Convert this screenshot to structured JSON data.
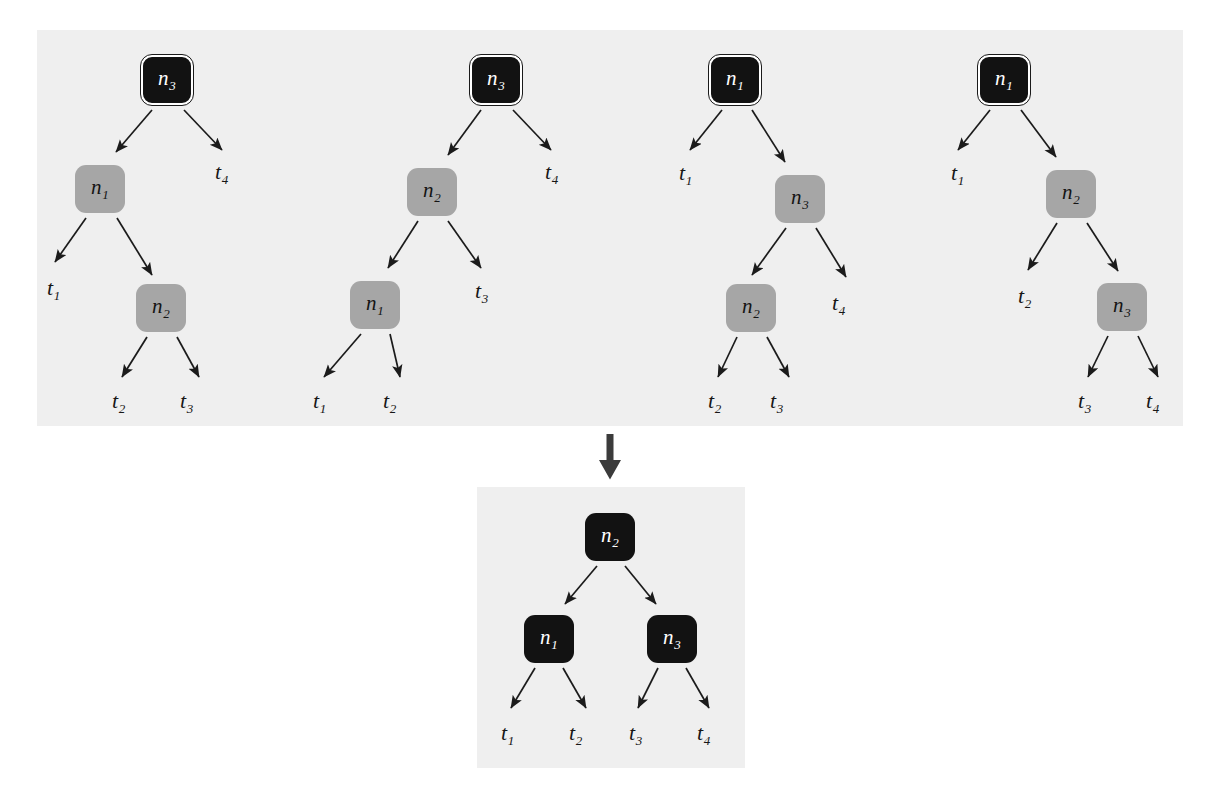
{
  "figure": {
    "type": "tree-diagram",
    "background_color": "#ffffff",
    "panel_color": "#efefef",
    "node_colors": {
      "root_dark": "#121212",
      "internal_gray": "#a6a6a6",
      "consensus_dark": "#121212",
      "ring": "#ffffff"
    }
  },
  "transition": {
    "icon": "down-arrow-icon"
  },
  "top_panel": {
    "label": "Input trees panel",
    "trees": [
      {
        "id": "tree-1",
        "nodes": [
          {
            "id": "t1-root",
            "label": "n",
            "sub": "3",
            "style": "dark-ring",
            "x": 141,
            "y": 55,
            "w": 52,
            "h": 50
          },
          {
            "id": "t1-n1",
            "label": "n",
            "sub": "1",
            "style": "gray",
            "x": 75,
            "y": 165,
            "w": 50,
            "h": 48
          },
          {
            "id": "t1-n2",
            "label": "n",
            "sub": "2",
            "style": "gray",
            "x": 136,
            "y": 284,
            "w": 50,
            "h": 48
          }
        ],
        "leaves": [
          {
            "id": "t1-t4",
            "label": "t",
            "sub": "4",
            "x": 215,
            "y": 161
          },
          {
            "id": "t1-t1",
            "label": "t",
            "sub": "1",
            "x": 47,
            "y": 277
          },
          {
            "id": "t1-t2",
            "label": "t",
            "sub": "2",
            "x": 112,
            "y": 390
          },
          {
            "id": "t1-t3",
            "label": "t",
            "sub": "3",
            "x": 180,
            "y": 390
          }
        ],
        "edges": [
          {
            "x1": 152,
            "y1": 110,
            "x2": 116,
            "y2": 152
          },
          {
            "x1": 184,
            "y1": 110,
            "x2": 222,
            "y2": 150
          },
          {
            "x1": 86,
            "y1": 218,
            "x2": 55,
            "y2": 262
          },
          {
            "x1": 117,
            "y1": 218,
            "x2": 152,
            "y2": 275
          },
          {
            "x1": 147,
            "y1": 337,
            "x2": 122,
            "y2": 377
          },
          {
            "x1": 177,
            "y1": 337,
            "x2": 199,
            "y2": 377
          }
        ]
      },
      {
        "id": "tree-2",
        "nodes": [
          {
            "id": "t2-root",
            "label": "n",
            "sub": "3",
            "style": "dark-ring",
            "x": 470,
            "y": 55,
            "w": 52,
            "h": 50
          },
          {
            "id": "t2-n2",
            "label": "n",
            "sub": "2",
            "style": "gray",
            "x": 407,
            "y": 168,
            "w": 50,
            "h": 48
          },
          {
            "id": "t2-n1",
            "label": "n",
            "sub": "1",
            "style": "gray",
            "x": 350,
            "y": 281,
            "w": 50,
            "h": 48
          }
        ],
        "leaves": [
          {
            "id": "t2-t4",
            "label": "t",
            "sub": "4",
            "x": 545,
            "y": 161
          },
          {
            "id": "t2-t3",
            "label": "t",
            "sub": "3",
            "x": 475,
            "y": 280
          },
          {
            "id": "t2-t1",
            "label": "t",
            "sub": "1",
            "x": 313,
            "y": 390
          },
          {
            "id": "t2-t2",
            "label": "t",
            "sub": "2",
            "x": 383,
            "y": 390
          }
        ],
        "edges": [
          {
            "x1": 481,
            "y1": 110,
            "x2": 448,
            "y2": 155
          },
          {
            "x1": 513,
            "y1": 110,
            "x2": 551,
            "y2": 150
          },
          {
            "x1": 418,
            "y1": 221,
            "x2": 388,
            "y2": 268
          },
          {
            "x1": 448,
            "y1": 221,
            "x2": 481,
            "y2": 268
          },
          {
            "x1": 361,
            "y1": 334,
            "x2": 324,
            "y2": 377
          },
          {
            "x1": 390,
            "y1": 334,
            "x2": 400,
            "y2": 377
          }
        ]
      },
      {
        "id": "tree-3",
        "nodes": [
          {
            "id": "t3-root",
            "label": "n",
            "sub": "1",
            "style": "dark-ring",
            "x": 709,
            "y": 55,
            "w": 52,
            "h": 50
          },
          {
            "id": "t3-n3",
            "label": "n",
            "sub": "3",
            "style": "gray",
            "x": 775,
            "y": 175,
            "w": 50,
            "h": 48
          },
          {
            "id": "t3-n2",
            "label": "n",
            "sub": "2",
            "style": "gray",
            "x": 726,
            "y": 284,
            "w": 50,
            "h": 48
          }
        ],
        "leaves": [
          {
            "id": "t3-t1",
            "label": "t",
            "sub": "1",
            "x": 679,
            "y": 162
          },
          {
            "id": "t3-t4",
            "label": "t",
            "sub": "4",
            "x": 832,
            "y": 292
          },
          {
            "id": "t3-t2",
            "label": "t",
            "sub": "2",
            "x": 708,
            "y": 390
          },
          {
            "id": "t3-t3",
            "label": "t",
            "sub": "3",
            "x": 770,
            "y": 390
          }
        ],
        "edges": [
          {
            "x1": 722,
            "y1": 110,
            "x2": 690,
            "y2": 150
          },
          {
            "x1": 752,
            "y1": 110,
            "x2": 785,
            "y2": 162
          },
          {
            "x1": 786,
            "y1": 228,
            "x2": 752,
            "y2": 275
          },
          {
            "x1": 816,
            "y1": 228,
            "x2": 846,
            "y2": 277
          },
          {
            "x1": 737,
            "y1": 337,
            "x2": 718,
            "y2": 377
          },
          {
            "x1": 767,
            "y1": 337,
            "x2": 789,
            "y2": 377
          }
        ]
      },
      {
        "id": "tree-4",
        "nodes": [
          {
            "id": "t4-root",
            "label": "n",
            "sub": "1",
            "style": "dark-ring",
            "x": 978,
            "y": 55,
            "w": 52,
            "h": 50
          },
          {
            "id": "t4-n2",
            "label": "n",
            "sub": "2",
            "style": "gray",
            "x": 1046,
            "y": 170,
            "w": 50,
            "h": 48
          },
          {
            "id": "t4-n3",
            "label": "n",
            "sub": "3",
            "style": "gray",
            "x": 1097,
            "y": 283,
            "w": 50,
            "h": 48
          }
        ],
        "leaves": [
          {
            "id": "t4-t1",
            "label": "t",
            "sub": "1",
            "x": 951,
            "y": 162
          },
          {
            "id": "t4-t2",
            "label": "t",
            "sub": "2",
            "x": 1018,
            "y": 285
          },
          {
            "id": "t4-t3",
            "label": "t",
            "sub": "3",
            "x": 1078,
            "y": 390
          },
          {
            "id": "t4-t4",
            "label": "t",
            "sub": "4",
            "x": 1146,
            "y": 390
          }
        ],
        "edges": [
          {
            "x1": 990,
            "y1": 110,
            "x2": 958,
            "y2": 150
          },
          {
            "x1": 1021,
            "y1": 110,
            "x2": 1056,
            "y2": 157
          },
          {
            "x1": 1057,
            "y1": 223,
            "x2": 1028,
            "y2": 270
          },
          {
            "x1": 1087,
            "y1": 223,
            "x2": 1118,
            "y2": 271
          },
          {
            "x1": 1108,
            "y1": 336,
            "x2": 1088,
            "y2": 377
          },
          {
            "x1": 1138,
            "y1": 336,
            "x2": 1158,
            "y2": 377
          }
        ]
      }
    ]
  },
  "bottom_panel": {
    "label": "Consensus tree panel",
    "tree": {
      "id": "consensus-tree",
      "nodes": [
        {
          "id": "c-root",
          "label": "n",
          "sub": "2",
          "style": "dark",
          "x": 585,
          "y": 513,
          "w": 50,
          "h": 48
        },
        {
          "id": "c-n1",
          "label": "n",
          "sub": "1",
          "style": "dark",
          "x": 524,
          "y": 615,
          "w": 50,
          "h": 48
        },
        {
          "id": "c-n3",
          "label": "n",
          "sub": "3",
          "style": "dark",
          "x": 647,
          "y": 615,
          "w": 50,
          "h": 48
        }
      ],
      "leaves": [
        {
          "id": "c-t1",
          "label": "t",
          "sub": "1",
          "x": 501,
          "y": 722
        },
        {
          "id": "c-t2",
          "label": "t",
          "sub": "2",
          "x": 569,
          "y": 722
        },
        {
          "id": "c-t3",
          "label": "t",
          "sub": "3",
          "x": 629,
          "y": 722
        },
        {
          "id": "c-t4",
          "label": "t",
          "sub": "4",
          "x": 697,
          "y": 722
        }
      ],
      "edges": [
        {
          "x1": 597,
          "y1": 566,
          "x2": 565,
          "y2": 604
        },
        {
          "x1": 625,
          "y1": 566,
          "x2": 656,
          "y2": 604
        },
        {
          "x1": 535,
          "y1": 668,
          "x2": 511,
          "y2": 708
        },
        {
          "x1": 563,
          "y1": 668,
          "x2": 586,
          "y2": 708
        },
        {
          "x1": 658,
          "y1": 668,
          "x2": 638,
          "y2": 708
        },
        {
          "x1": 686,
          "y1": 668,
          "x2": 709,
          "y2": 708
        }
      ]
    }
  }
}
